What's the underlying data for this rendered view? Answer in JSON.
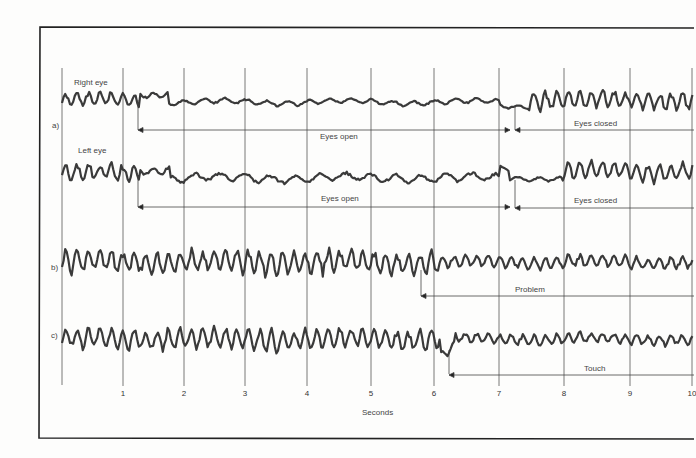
{
  "figure": {
    "panel_labels": [
      "a)",
      "b)",
      "c)"
    ],
    "trace_labels": {
      "right_eye": "Right eye",
      "left_eye": "Left eye"
    },
    "annotations": {
      "right_open": "Eyes open",
      "right_closed": "Eyes closed",
      "left_open": "Eyes open",
      "left_closed": "Eyes closed",
      "b_event": "Problem",
      "c_event": "Touch"
    },
    "xlabel": "Seconds",
    "ticks": [
      "1",
      "2",
      "3",
      "4",
      "5",
      "6",
      "7",
      "8",
      "9",
      "10"
    ]
  },
  "chart_data": {
    "type": "line",
    "title": "",
    "xlabel": "Seconds",
    "ylabel": "",
    "xlim": [
      0,
      10
    ],
    "grid": "vertical lines at each second",
    "x_ticks": [
      1,
      2,
      3,
      4,
      5,
      6,
      7,
      8,
      9,
      10
    ],
    "series": [
      {
        "name": "a) Right eye",
        "description": "High-amplitude alpha rhythm 0–1.3 s; suppressed low-amplitude activity while eyes open (1.3–7.25 s); alpha returns after eyes closed (7.25 s onward)",
        "events": [
          {
            "label": "Eyes open",
            "start": 1.3,
            "end": 7.2
          },
          {
            "label": "Eyes closed",
            "start": 7.3,
            "end": 10
          }
        ]
      },
      {
        "name": "a) Left eye",
        "description": "Same pattern as right eye: alpha blocked while eyes open, returns on closing",
        "events": [
          {
            "label": "Eyes open",
            "start": 1.3,
            "end": 7.2
          },
          {
            "label": "Eyes closed",
            "start": 7.3,
            "end": 10
          }
        ]
      },
      {
        "name": "b)",
        "description": "Continuous alpha rhythm, amplitude reduced after problem presented at ~5.8 s",
        "events": [
          {
            "label": "Problem",
            "start": 5.8,
            "end": 10
          }
        ]
      },
      {
        "name": "c)",
        "description": "Alpha rhythm blocked abruptly by touch at ~6.25 s, low amplitude afterwards with partial recovery",
        "events": [
          {
            "label": "Touch",
            "start": 6.25,
            "end": 10
          }
        ]
      }
    ]
  }
}
